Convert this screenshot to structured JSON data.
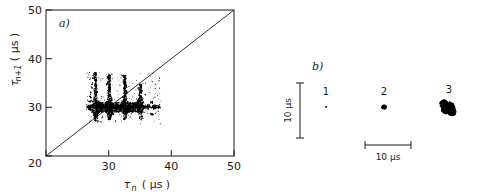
{
  "figure": {
    "background": "#ffffff",
    "ink": "#000000"
  },
  "panel_a": {
    "label": "a)",
    "xlabel_symbol": "τ",
    "xlabel_sub": "n",
    "xlabel_units": "( μs )",
    "ylabel_symbol": "τ",
    "ylabel_sub": "n+1",
    "ylabel_units": "( μs )",
    "xticks": [
      "20",
      "30",
      "40",
      "50"
    ],
    "yticks": [
      "20",
      "30",
      "40",
      "50"
    ],
    "diagonal_note": "identity line"
  },
  "panel_b": {
    "label": "b)",
    "clusters": [
      {
        "name": "1",
        "label": "1"
      },
      {
        "name": "2",
        "label": "2"
      },
      {
        "name": "3",
        "label": "3"
      }
    ],
    "vertical_scalebar_label": "10 μs",
    "horizontal_scalebar_label": "10 μs"
  },
  "chart_data": {
    "type": "scatter",
    "title": "",
    "panels": [
      {
        "id": "a",
        "label": "a)",
        "type": "scatter",
        "xlabel": "τ_n (μs)",
        "ylabel": "τ_{n+1} (μs)",
        "xlim": [
          20,
          50
        ],
        "ylim": [
          20,
          50
        ],
        "xticks": [
          20,
          30,
          40,
          50
        ],
        "yticks": [
          20,
          30,
          40,
          50
        ],
        "grid": false,
        "legend": "none",
        "annotations": [
          {
            "text": "a)",
            "x": 22.1,
            "y": 47.4
          }
        ],
        "reference_lines": [
          {
            "name": "identity",
            "from": [
              20,
              20
            ],
            "to": [
              50,
              50
            ]
          }
        ],
        "series": [
          {
            "name": "return-map-points",
            "marker": "point",
            "color": "#000000",
            "description": "Dense return map cloud of successive interspike intervals, concentrated between tau_n 26.5 and 38 us with a dominant horizontal band near tau_{n+1} = 30 us and several near-vertical spike branches.",
            "x": [
              26.6,
              26.7,
              26.8,
              26.9,
              27.0,
              27.0,
              27.1,
              27.1,
              27.2,
              27.2,
              27.3,
              27.3,
              27.4,
              27.4,
              27.5,
              27.5,
              27.6,
              27.6,
              27.7,
              27.7,
              27.8,
              27.8,
              27.8,
              27.9,
              27.9,
              27.9,
              28.0,
              28.0,
              28.0,
              28.0,
              28.0,
              28.1,
              28.1,
              28.1,
              28.1,
              28.2,
              28.2,
              28.2,
              28.3,
              28.3,
              28.4,
              28.5,
              28.6,
              28.7,
              28.9,
              29.0,
              29.2,
              29.4,
              29.6,
              29.7,
              29.8,
              29.9,
              29.9,
              30.0,
              30.0,
              30.0,
              30.0,
              30.1,
              30.1,
              30.1,
              30.1,
              30.2,
              30.2,
              30.2,
              30.2,
              30.3,
              30.3,
              30.3,
              30.4,
              30.4,
              30.5,
              30.5,
              30.6,
              30.6,
              30.7,
              30.8,
              30.9,
              31.0,
              31.1,
              31.2,
              31.3,
              31.4,
              31.5,
              31.6,
              31.7,
              31.8,
              31.9,
              32.0,
              32.1,
              32.2,
              32.3,
              32.3,
              32.4,
              32.4,
              32.5,
              32.5,
              32.5,
              32.6,
              32.6,
              32.6,
              32.6,
              32.7,
              32.7,
              32.7,
              32.7,
              32.8,
              32.8,
              32.8,
              32.9,
              32.9,
              33.0,
              33.1,
              33.2,
              33.4,
              33.6,
              33.8,
              34.0,
              34.2,
              34.4,
              34.6,
              34.8,
              34.9,
              35.0,
              35.0,
              35.1,
              35.1,
              35.2,
              35.2,
              35.3,
              35.3,
              35.4,
              35.5,
              35.6,
              35.8,
              36.0,
              36.2,
              36.4,
              36.6,
              36.8,
              36.9,
              37.0,
              37.1,
              37.2,
              37.3,
              37.4,
              37.6,
              37.8,
              38.0
            ],
            "y": [
              30.1,
              29.9,
              30.2,
              29.8,
              30.0,
              31.2,
              29.6,
              32.0,
              30.3,
              33.0,
              29.4,
              34.0,
              30.1,
              35.0,
              29.1,
              36.0,
              30.4,
              36.8,
              28.9,
              33.5,
              30.0,
              32.2,
              27.6,
              31.0,
              30.2,
              28.3,
              34.5,
              32.8,
              31.4,
              30.0,
              28.6,
              35.5,
              33.2,
              31.0,
              29.2,
              30.5,
              28.0,
              27.2,
              30.1,
              29.0,
              30.3,
              29.8,
              30.0,
              30.2,
              29.9,
              30.4,
              30.1,
              30.0,
              30.3,
              34.8,
              36.2,
              35.0,
              33.4,
              32.0,
              30.8,
              30.0,
              28.8,
              33.8,
              32.6,
              31.2,
              29.6,
              35.8,
              34.2,
              30.4,
              27.9,
              32.4,
              31.0,
              29.3,
              30.6,
              28.2,
              31.8,
              30.0,
              30.5,
              28.6,
              30.2,
              30.1,
              30.3,
              30.0,
              30.2,
              30.1,
              30.3,
              30.0,
              30.4,
              30.1,
              30.2,
              30.0,
              30.3,
              30.1,
              30.5,
              30.0,
              36.5,
              30.2,
              35.2,
              31.1,
              34.0,
              32.2,
              30.0,
              36.0,
              33.4,
              31.4,
              29.5,
              35.0,
              32.8,
              30.6,
              28.4,
              34.2,
              31.6,
              29.0,
              33.0,
              30.2,
              31.0,
              29.8,
              30.1,
              30.3,
              30.0,
              30.2,
              30.1,
              30.4,
              30.0,
              30.2,
              33.8,
              32.6,
              34.6,
              31.4,
              33.2,
              30.2,
              32.0,
              28.9,
              30.8,
              27.8,
              31.6,
              30.1,
              30.3,
              30.0,
              30.2,
              29.9,
              30.4,
              30.1,
              31.0,
              28.6,
              30.2,
              30.0,
              30.3,
              29.7,
              30.1,
              30.2,
              30.0,
              30.1
            ]
          }
        ]
      },
      {
        "id": "b",
        "label": "b)",
        "type": "scatter",
        "xlabel": "10 μs",
        "ylabel": "10 μs",
        "grid": false,
        "axes_visible": false,
        "legend": "none",
        "scalebars": [
          {
            "orientation": "vertical",
            "label": "10 μs"
          },
          {
            "orientation": "horizontal",
            "label": "10 μs"
          }
        ],
        "clusters": [
          {
            "label": "1",
            "size": "point",
            "radius_us": 0.4,
            "n_points": 1
          },
          {
            "label": "2",
            "size": "small-blob",
            "radius_us": 1.1,
            "n_points": 40
          },
          {
            "label": "3",
            "size": "large-blob",
            "radius_us": 2.6,
            "n_points": 220
          }
        ]
      }
    ]
  }
}
